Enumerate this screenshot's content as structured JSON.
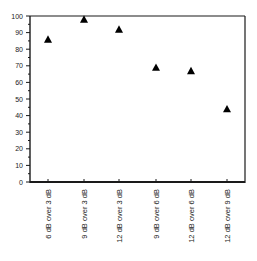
{
  "chart_data": {
    "type": "scatter",
    "title": "",
    "xlabel": "",
    "ylabel": "",
    "ylim": [
      0,
      100
    ],
    "yticks": [
      0,
      10,
      20,
      30,
      40,
      50,
      60,
      70,
      80,
      90,
      100
    ],
    "grid": false,
    "legend": null,
    "marker": "triangle",
    "categories": [
      "6 dB over 3 dB",
      "9 dB over 3 dB",
      "12 dB over 3 dB",
      "9 dB over 6 dB",
      "12 dB over 6 dB",
      "12 dB over 9 dB"
    ],
    "values": [
      86,
      98,
      92,
      69,
      67,
      44
    ]
  },
  "style": {
    "axis_color": "#1a1a1a",
    "marker_color": "#000000",
    "label_color": "#222222"
  }
}
